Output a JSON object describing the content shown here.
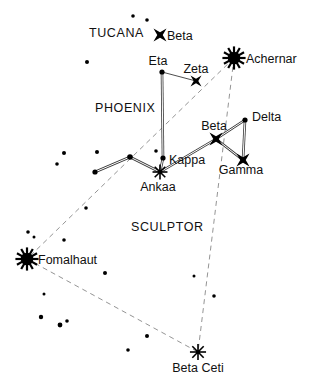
{
  "chart_data": {
    "type": "scatter",
    "title": "",
    "xlabel": "",
    "ylabel": "",
    "xlim": [
      0,
      309
    ],
    "ylim": [
      0,
      391
    ],
    "grid": false,
    "legend": null,
    "constellation_labels": [
      {
        "name": "TUCANA",
        "text": "TUCANA",
        "x": 89,
        "y": 37
      },
      {
        "name": "PHOENIX",
        "text": "PHOENIX",
        "x": 95,
        "y": 112
      },
      {
        "name": "SCULPTOR",
        "text": "SCULPTOR",
        "x": 131,
        "y": 231
      }
    ],
    "stars": [
      {
        "id": "beta-tucanae",
        "label": "Beta",
        "x": 160,
        "y": 35,
        "marker": "cross",
        "size": 6.5,
        "label_dx": 7,
        "label_dy": 5,
        "anchor": "start"
      },
      {
        "id": "achernar",
        "label": "Achernar",
        "x": 234,
        "y": 58,
        "marker": "bright",
        "size": 9.5,
        "label_dx": 12,
        "label_dy": 5,
        "anchor": "start"
      },
      {
        "id": "eta-phoenicis",
        "label": "Eta",
        "x": 162,
        "y": 72,
        "marker": "dot",
        "size": 2.6,
        "label_dx": -4,
        "label_dy": -7,
        "anchor": "middle"
      },
      {
        "id": "zeta-phoenicis",
        "label": "Zeta",
        "x": 196,
        "y": 81,
        "marker": "cross",
        "size": 5.5,
        "label_dx": 0,
        "label_dy": -8,
        "anchor": "middle"
      },
      {
        "id": "delta-phoenicis",
        "label": "Delta",
        "x": 245,
        "y": 120,
        "marker": "dot",
        "size": 2.6,
        "label_dx": 7,
        "label_dy": 1,
        "anchor": "start"
      },
      {
        "id": "beta-phoenicis",
        "label": "Beta",
        "x": 216,
        "y": 139,
        "marker": "cross",
        "size": 6.5,
        "label_dx": -2,
        "label_dy": -9,
        "anchor": "middle"
      },
      {
        "id": "gamma-phoenicis",
        "label": "Gamma",
        "x": 243,
        "y": 160,
        "marker": "cross",
        "size": 6.5,
        "label_dx": -2,
        "label_dy": 14,
        "anchor": "middle"
      },
      {
        "id": "kappa-phoenicis",
        "label": "Kappa",
        "x": 163,
        "y": 158,
        "marker": "dot",
        "size": 2.6,
        "label_dx": 6,
        "label_dy": 6,
        "anchor": "start"
      },
      {
        "id": "ankaa",
        "label": "Ankaa",
        "x": 160,
        "y": 172,
        "marker": "medium",
        "size": 6.5,
        "label_dx": -2,
        "label_dy": 19,
        "anchor": "middle"
      },
      {
        "id": "fomalhaut",
        "label": "Fomalhaut",
        "x": 27,
        "y": 259,
        "marker": "bright",
        "size": 9.5,
        "label_dx": 11,
        "label_dy": 5,
        "anchor": "start"
      },
      {
        "id": "beta-ceti",
        "label": "Beta Ceti",
        "x": 198,
        "y": 352,
        "marker": "medium",
        "size": 7.0,
        "label_dx": 0,
        "label_dy": 20,
        "anchor": "middle"
      }
    ],
    "unlabeled_stars": [
      {
        "x": 133,
        "y": 16,
        "size": 1.8
      },
      {
        "x": 147,
        "y": 20,
        "size": 1.8
      },
      {
        "x": 87,
        "y": 62,
        "size": 2.0
      },
      {
        "x": 130,
        "y": 157,
        "size": 2.8
      },
      {
        "x": 95,
        "y": 172,
        "size": 2.6
      },
      {
        "x": 64,
        "y": 153,
        "size": 2.0
      },
      {
        "x": 97,
        "y": 152,
        "size": 2.0
      },
      {
        "x": 57,
        "y": 164,
        "size": 1.8
      },
      {
        "x": 156,
        "y": 151,
        "size": 1.8
      },
      {
        "x": 86,
        "y": 208,
        "size": 1.8
      },
      {
        "x": 28,
        "y": 232,
        "size": 1.8
      },
      {
        "x": 34,
        "y": 237,
        "size": 1.5
      },
      {
        "x": 64,
        "y": 240,
        "size": 1.8
      },
      {
        "x": 105,
        "y": 273,
        "size": 2.0
      },
      {
        "x": 44,
        "y": 294,
        "size": 1.5
      },
      {
        "x": 41,
        "y": 317,
        "size": 2.2
      },
      {
        "x": 60,
        "y": 325,
        "size": 2.4
      },
      {
        "x": 67,
        "y": 321,
        "size": 1.8
      },
      {
        "x": 147,
        "y": 336,
        "size": 2.0
      },
      {
        "x": 128,
        "y": 350,
        "size": 1.8
      },
      {
        "x": 214,
        "y": 296,
        "size": 1.8
      },
      {
        "x": 194,
        "y": 276,
        "size": 1.5
      }
    ],
    "constellation_lines": [
      {
        "name": "eta-kappa",
        "from": [
          162,
          72
        ],
        "to": [
          163,
          158
        ],
        "style": "double"
      },
      {
        "name": "eta-zeta",
        "from": [
          162,
          72
        ],
        "to": [
          196,
          81
        ],
        "style": "single"
      },
      {
        "name": "kappa-ankaa",
        "from": [
          163,
          158
        ],
        "to": [
          160,
          172
        ],
        "style": "double"
      },
      {
        "name": "ankaa-vertex",
        "from": [
          160,
          172
        ],
        "to": [
          130,
          157
        ],
        "style": "double"
      },
      {
        "name": "vertex-west",
        "from": [
          130,
          157
        ],
        "to": [
          95,
          172
        ],
        "style": "double"
      },
      {
        "name": "ankaa-beta",
        "from": [
          160,
          172
        ],
        "to": [
          216,
          139
        ],
        "style": "double"
      },
      {
        "name": "beta-delta",
        "from": [
          216,
          139
        ],
        "to": [
          245,
          120
        ],
        "style": "double"
      },
      {
        "name": "delta-gamma",
        "from": [
          245,
          120
        ],
        "to": [
          243,
          160
        ],
        "style": "double"
      },
      {
        "name": "beta-gamma",
        "from": [
          216,
          139
        ],
        "to": [
          243,
          160
        ],
        "style": "double"
      }
    ],
    "guide_lines": [
      {
        "name": "achernar-fomalhaut",
        "from": [
          234,
          58
        ],
        "to": [
          27,
          259
        ],
        "style": "dashed"
      },
      {
        "name": "achernar-beta-ceti",
        "from": [
          234,
          58
        ],
        "to": [
          198,
          352
        ],
        "style": "dashed"
      },
      {
        "name": "fomalhaut-beta-ceti",
        "from": [
          27,
          259
        ],
        "to": [
          198,
          352
        ],
        "style": "dashed"
      }
    ],
    "colors": {
      "background": "#ffffff",
      "star": "#000000",
      "line": "#555555",
      "dashed": "#888888",
      "text": "#111111"
    }
  }
}
